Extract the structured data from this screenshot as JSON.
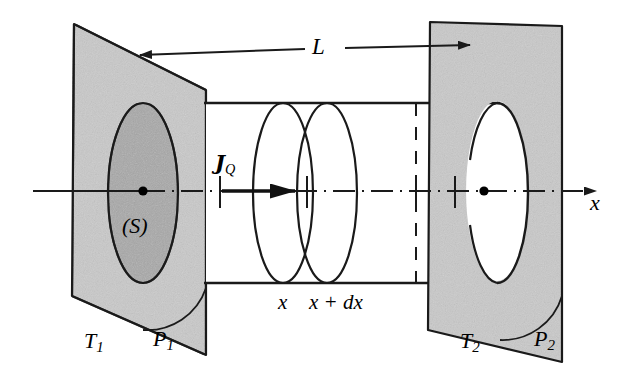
{
  "figure": {
    "background_color": "#ffffff",
    "line_color": "#1a1a1a",
    "plane_fill": "#c9c9c9",
    "disc_fill": "#a8a8a8",
    "width": 635,
    "height": 389
  },
  "labels": {
    "length": "L",
    "temperature_left": "T",
    "temperature_left_sub": "1",
    "temperature_right": "T",
    "temperature_right_sub": "2",
    "plane_left": "P",
    "plane_left_sub": "1",
    "plane_right": "P",
    "plane_right_sub": "2",
    "surface": "(S)",
    "axis": "x",
    "slice_start": "x",
    "slice_end": "x + dx",
    "heat_flux": "J",
    "heat_flux_sub": "Q"
  },
  "geometry": {
    "left_plane": {
      "name": "P1",
      "points": "74,24 206,90 206,355 72,296",
      "fill": "#c9c9c9"
    },
    "right_plane": {
      "name": "P2",
      "points": "430,22 562,26 562,362 428,330",
      "fill": "#c9c9c9"
    },
    "cylinder": {
      "top_y": 103,
      "bottom_y": 283,
      "left_x": 206,
      "right_x": 497,
      "cap_rx": 31,
      "cap_ry": 90
    },
    "axis_line": {
      "x1": 33,
      "y1": 191,
      "x2": 607,
      "y2": 191
    },
    "surface_ellipse": {
      "cx": 143,
      "cy": 193,
      "rx": 35,
      "ry": 90
    },
    "cross_sections": [
      {
        "label": "x",
        "cx": 283,
        "rx": 30,
        "ry": 90
      },
      {
        "label": "x + dx",
        "cx": 327,
        "rx": 30,
        "ry": 90
      }
    ],
    "dashed_divider_x": 416,
    "dimension_line": {
      "x1": 127,
      "y1": 57,
      "x2": 465,
      "y2": 45
    },
    "flux_arrow": {
      "x1": 228,
      "y1": 191,
      "x2": 297,
      "y2": 191
    },
    "center_dots": [
      {
        "cx": 143,
        "cy": 191
      },
      {
        "cx": 484,
        "cy": 191
      }
    ]
  }
}
